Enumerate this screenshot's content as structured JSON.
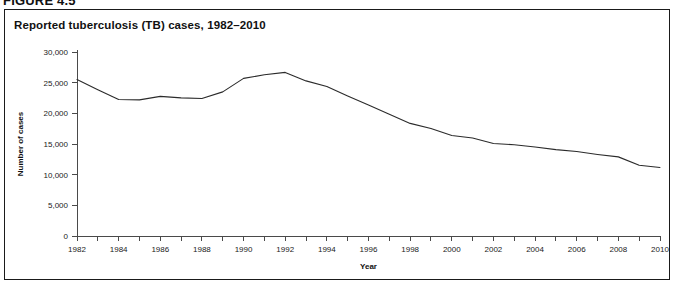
{
  "figure": {
    "label": "FIGURE 4.5",
    "panel_title": "Reported tuberculosis (TB) cases, 1982–2010"
  },
  "colors": {
    "line": "#2b2b2b",
    "axis": "#4a4a4a",
    "border": "#1a1a1a",
    "background": "#ffffff",
    "text": "#111111"
  },
  "chart_data": {
    "type": "line",
    "title": "Reported tuberculosis (TB) cases, 1982–2010",
    "xlabel": "Year",
    "ylabel": "Number of cases",
    "xlim": [
      1982,
      2010
    ],
    "ylim": [
      0,
      30000
    ],
    "grid": false,
    "legend": "none",
    "y_ticks": [
      0,
      5000,
      10000,
      15000,
      20000,
      25000,
      30000
    ],
    "y_tick_labels": [
      "0",
      "5,000",
      "10,000",
      "15,000",
      "20,000",
      "25,000",
      "30,000"
    ],
    "x_ticks": [
      1982,
      1983,
      1984,
      1985,
      1986,
      1987,
      1988,
      1989,
      1990,
      1991,
      1992,
      1993,
      1994,
      1995,
      1996,
      1997,
      1998,
      1999,
      2000,
      2001,
      2002,
      2003,
      2004,
      2005,
      2006,
      2007,
      2008,
      2009,
      2010
    ],
    "x_tick_labels": [
      "1982",
      "",
      "1984",
      "",
      "1986",
      "",
      "1988",
      "",
      "1990",
      "",
      "1992",
      "",
      "1994",
      "",
      "1996",
      "",
      "1998",
      "",
      "2000",
      "",
      "2002",
      "",
      "2004",
      "",
      "2006",
      "",
      "2008",
      "",
      "2010"
    ],
    "x": [
      1982,
      1983,
      1984,
      1985,
      1986,
      1987,
      1988,
      1989,
      1990,
      1991,
      1992,
      1993,
      1994,
      1995,
      1996,
      1997,
      1998,
      1999,
      2000,
      2001,
      2002,
      2003,
      2004,
      2005,
      2006,
      2007,
      2008,
      2009,
      2010
    ],
    "values": [
      25520,
      23850,
      22250,
      22200,
      22770,
      22520,
      22430,
      23500,
      25700,
      26280,
      26670,
      25290,
      24360,
      22810,
      21340,
      19840,
      18360,
      17530,
      16380,
      15990,
      15080,
      14870,
      14510,
      14090,
      13770,
      13300,
      12900,
      11530,
      11180
    ],
    "series": [
      {
        "name": "Reported TB cases",
        "values": [
          25520,
          23850,
          22250,
          22200,
          22770,
          22520,
          22430,
          23500,
          25700,
          26280,
          26670,
          25290,
          24360,
          22810,
          21340,
          19840,
          18360,
          17530,
          16380,
          15990,
          15080,
          14870,
          14510,
          14090,
          13770,
          13300,
          12900,
          11530,
          11180
        ]
      }
    ]
  }
}
